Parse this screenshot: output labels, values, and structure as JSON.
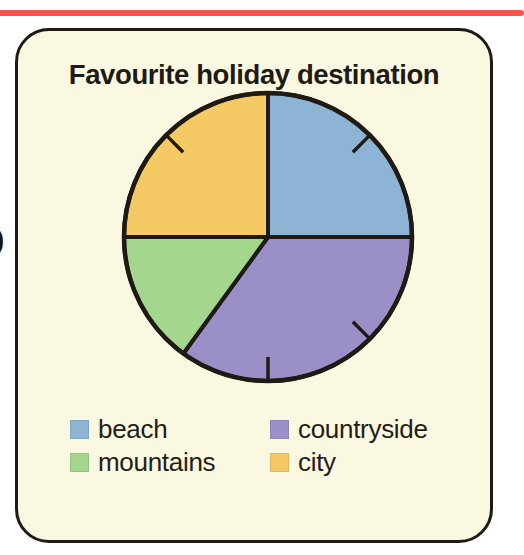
{
  "page": {
    "background_color": "#ffffff",
    "top_rule_color": "#f4564b",
    "margin_glyph": ")"
  },
  "card": {
    "background_color": "#fbf8e2",
    "border_color": "#1f1a14"
  },
  "chart_data": {
    "type": "pie",
    "title": "Favourite holiday destination",
    "xlabel": "",
    "ylabel": "",
    "grid": false,
    "legend_position": "bottom",
    "start_angle_deg": 0,
    "direction": "clockwise",
    "tick_marks_deg": [
      45,
      135,
      180,
      315
    ],
    "categories": [
      "beach",
      "countryside",
      "mountains",
      "city"
    ],
    "values": [
      25,
      35,
      15,
      25
    ],
    "angles_deg": [
      90,
      126,
      54,
      90
    ],
    "colors": [
      "#8db4d4",
      "#9b8fc8",
      "#a4d68e",
      "#f5c964"
    ],
    "slices": [
      {
        "label": "beach",
        "value": 25,
        "angle_deg": 90,
        "color": "#8db4d4",
        "start_deg": 0,
        "end_deg": 90
      },
      {
        "label": "countryside",
        "value": 35,
        "angle_deg": 126,
        "color": "#9b8fc8",
        "start_deg": 90,
        "end_deg": 216
      },
      {
        "label": "mountains",
        "value": 15,
        "angle_deg": 54,
        "color": "#a4d68e",
        "start_deg": 216,
        "end_deg": 270
      },
      {
        "label": "city",
        "value": 25,
        "angle_deg": 90,
        "color": "#f5c964",
        "start_deg": 270,
        "end_deg": 360
      }
    ],
    "outline_color": "#1f1a14"
  },
  "legend": {
    "rows": [
      [
        {
          "label": "beach",
          "color": "#8db4d4"
        },
        {
          "label": "countryside",
          "color": "#9b8fc8"
        }
      ],
      [
        {
          "label": "mountains",
          "color": "#a4d68e"
        },
        {
          "label": "city",
          "color": "#f5c964"
        }
      ]
    ]
  }
}
